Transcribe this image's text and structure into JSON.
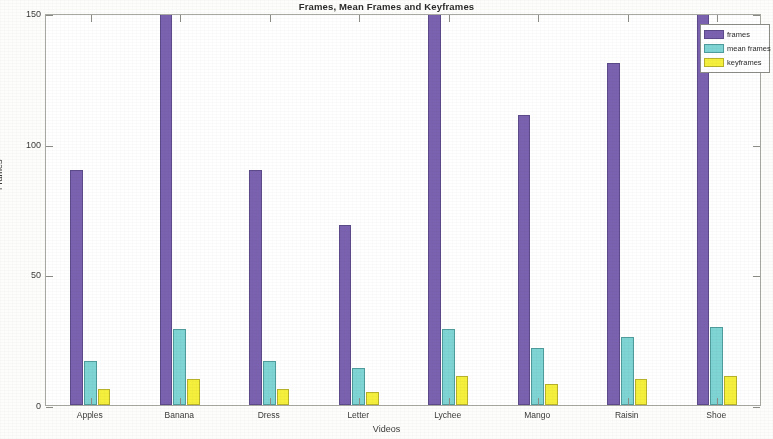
{
  "chart_data": {
    "type": "bar",
    "title": "Frames, Mean Frames and Keyframes",
    "xlabel": "Videos",
    "ylabel": "Frames",
    "categories": [
      "Apples",
      "Banana",
      "Dress",
      "Letter",
      "Lychee",
      "Mango",
      "Raisin",
      "Shoe"
    ],
    "series": [
      {
        "name": "frames",
        "color": "#7b62b0",
        "values": [
          90,
          168,
          90,
          69,
          163,
          111,
          131,
          172
        ]
      },
      {
        "name": "mean frames",
        "color": "#7fd4d4",
        "values": [
          17,
          29,
          17,
          14,
          29,
          22,
          26,
          30
        ]
      },
      {
        "name": "keyframes",
        "color": "#f5f03c",
        "values": [
          6,
          10,
          6,
          5,
          11,
          8,
          10,
          11
        ]
      }
    ],
    "ylim": [
      0,
      150
    ],
    "yticks": [
      0,
      50,
      100,
      150
    ],
    "ytick_labels": [
      "0",
      "50",
      "100",
      "150"
    ],
    "grid": false,
    "legend_position": "top-right"
  },
  "legend": {
    "entries": [
      {
        "label": "frames"
      },
      {
        "label": "mean frames"
      },
      {
        "label": "keyframes"
      }
    ]
  }
}
